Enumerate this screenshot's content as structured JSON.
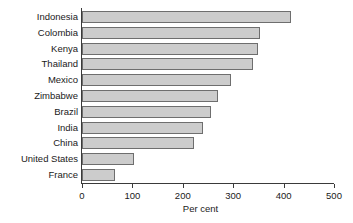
{
  "chart_data": {
    "type": "bar",
    "orientation": "horizontal",
    "title": "",
    "subtitle": "",
    "xlabel": "Per cent",
    "ylabel": "",
    "xlim": [
      0,
      500
    ],
    "xticks": [
      0,
      100,
      200,
      300,
      400,
      500
    ],
    "xtick_labels": [
      "0",
      "100",
      "200",
      "300",
      "400",
      "500"
    ],
    "grid": false,
    "legend": null,
    "categories": [
      "Indonesia",
      "Colombia",
      "Kenya",
      "Thailand",
      "Mexico",
      "Zimbabwe",
      "Brazil",
      "India",
      "China",
      "United States",
      "France"
    ],
    "values": [
      415,
      353,
      350,
      339,
      295,
      270,
      255,
      241,
      222,
      103,
      65
    ],
    "series": [
      {
        "name": "Per cent",
        "values": [
          415,
          353,
          350,
          339,
          295,
          270,
          255,
          241,
          222,
          103,
          65
        ]
      }
    ],
    "colors": {
      "bar_fill": "#cccccc",
      "bar_edge": "#6e6e6e",
      "axis": "#3a3a3a",
      "text": "#1a1a1a",
      "background": "#ffffff"
    }
  }
}
